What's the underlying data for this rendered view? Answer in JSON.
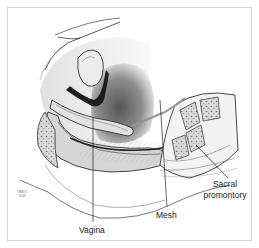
{
  "figure": {
    "type": "anatomical illustration",
    "labels": {
      "vagina": "Vagina",
      "mesh": "Mesh",
      "sacral_promontory_line1": "Sacral",
      "sacral_promontory_line2": "promontory"
    },
    "copyright": {
      "line1": "©MAYO",
      "line2": "2008"
    },
    "colors": {
      "line": "#2a2a2a",
      "tissue_light": "#e6e6e6",
      "tissue_mid": "#a8a8a8",
      "tissue_dark": "#1e1e1e",
      "frame": "#d4d4d4"
    }
  }
}
